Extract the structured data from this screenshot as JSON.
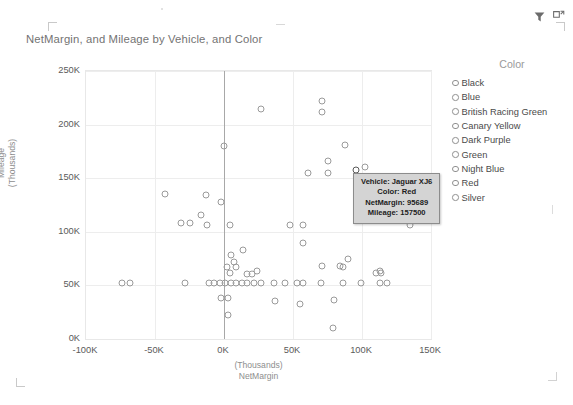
{
  "header": {
    "icons": [
      {
        "name": "filter-icon",
        "glyph": "filter"
      },
      {
        "name": "focus-mode-icon",
        "glyph": "focus"
      }
    ]
  },
  "chart_data": {
    "type": "scatter",
    "title": "NetMargin, and Mileage by Vehicle, and Color",
    "xlabel_line1": "(Thousands)",
    "xlabel_line2": "NetMargin",
    "ylabel_line1": "Mileage",
    "ylabel_line2": "(Thousands)",
    "xlim": [
      -100000,
      150000
    ],
    "ylim": [
      0,
      250000
    ],
    "xticks": [
      "-100K",
      "-50K",
      "0K",
      "50K",
      "100K",
      "150K"
    ],
    "xtick_values": [
      -100000,
      -50000,
      0,
      50000,
      100000,
      150000
    ],
    "yticks": [
      "0K",
      "50K",
      "100K",
      "150K",
      "200K",
      "250K"
    ],
    "ytick_values": [
      0,
      50000,
      100000,
      150000,
      200000,
      250000
    ],
    "grid": true,
    "legend_position": "right",
    "legend_title": "Color",
    "legend_entries": [
      "Black",
      "Blue",
      "British Racing Green",
      "Canary Yellow",
      "Dark Purple",
      "Green",
      "Night Blue",
      "Red",
      "Silver"
    ],
    "marker_style": "open-circle",
    "marker_color": "#9a9a9a",
    "points": [
      {
        "x": 27000,
        "y": 215000
      },
      {
        "x": 71000,
        "y": 222000
      },
      {
        "x": 71000,
        "y": 212000
      },
      {
        "x": 0,
        "y": 180000
      },
      {
        "x": 88000,
        "y": 181000
      },
      {
        "x": 75000,
        "y": 166000
      },
      {
        "x": 102000,
        "y": 160000
      },
      {
        "x": 61000,
        "y": 155000
      },
      {
        "x": 75000,
        "y": 155000
      },
      {
        "x": 95689,
        "y": 157500,
        "highlight": true
      },
      {
        "x": -43000,
        "y": 135000
      },
      {
        "x": -13000,
        "y": 134000
      },
      {
        "x": -2000,
        "y": 128000
      },
      {
        "x": -17000,
        "y": 116000
      },
      {
        "x": -25000,
        "y": 108000
      },
      {
        "x": -31000,
        "y": 108000
      },
      {
        "x": -12000,
        "y": 106000
      },
      {
        "x": 4000,
        "y": 106000
      },
      {
        "x": 48000,
        "y": 106000
      },
      {
        "x": 57000,
        "y": 106000
      },
      {
        "x": 135000,
        "y": 106000
      },
      {
        "x": 57000,
        "y": 90000
      },
      {
        "x": 14000,
        "y": 83000
      },
      {
        "x": 5000,
        "y": 78000
      },
      {
        "x": 7000,
        "y": 72000
      },
      {
        "x": 90000,
        "y": 75000
      },
      {
        "x": 2000,
        "y": 67000
      },
      {
        "x": 9000,
        "y": 67000
      },
      {
        "x": 71000,
        "y": 68000
      },
      {
        "x": 84000,
        "y": 68000
      },
      {
        "x": 86000,
        "y": 67000
      },
      {
        "x": 4000,
        "y": 62000
      },
      {
        "x": 17000,
        "y": 61000
      },
      {
        "x": 20000,
        "y": 61000
      },
      {
        "x": 24000,
        "y": 63000
      },
      {
        "x": 110000,
        "y": 62000
      },
      {
        "x": 113000,
        "y": 63000
      },
      {
        "x": 114000,
        "y": 62000
      },
      {
        "x": -74000,
        "y": 52000
      },
      {
        "x": -68000,
        "y": 52000
      },
      {
        "x": -28000,
        "y": 52000
      },
      {
        "x": -11000,
        "y": 52000
      },
      {
        "x": -7000,
        "y": 52000
      },
      {
        "x": -3000,
        "y": 52000
      },
      {
        "x": 1000,
        "y": 52000
      },
      {
        "x": 5000,
        "y": 52000
      },
      {
        "x": 9000,
        "y": 52000
      },
      {
        "x": 13000,
        "y": 52000
      },
      {
        "x": 17000,
        "y": 52000
      },
      {
        "x": 22000,
        "y": 52000
      },
      {
        "x": 27000,
        "y": 52000
      },
      {
        "x": 36000,
        "y": 52000
      },
      {
        "x": 44000,
        "y": 52000
      },
      {
        "x": 53000,
        "y": 52000
      },
      {
        "x": 57000,
        "y": 52000
      },
      {
        "x": 70000,
        "y": 52000
      },
      {
        "x": 86000,
        "y": 52000
      },
      {
        "x": 99000,
        "y": 52000
      },
      {
        "x": 113000,
        "y": 52000
      },
      {
        "x": 118000,
        "y": 52000
      },
      {
        "x": -2000,
        "y": 38000
      },
      {
        "x": 3000,
        "y": 38000
      },
      {
        "x": 37000,
        "y": 35000
      },
      {
        "x": 55000,
        "y": 33000
      },
      {
        "x": 80000,
        "y": 36000
      },
      {
        "x": 3000,
        "y": 22000
      },
      {
        "x": 79000,
        "y": 10000
      }
    ]
  },
  "tooltip": {
    "lines": [
      "Vehicle: Jaguar XJ6",
      "Color: Red",
      "NetMargin: 95689",
      "Mileage: 157500"
    ]
  }
}
